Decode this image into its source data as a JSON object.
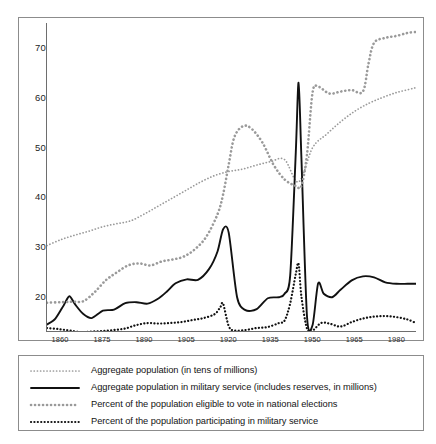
{
  "chart_data": {
    "type": "line",
    "title": "",
    "subtitle": "",
    "xlabel": "",
    "ylabel": "",
    "xlim": [
      1855,
      1987
    ],
    "ylim": [
      13,
      75
    ],
    "grid": false,
    "legend_position": "below-plot",
    "x_ticks": [
      "1860",
      "1875",
      "1890",
      "1905",
      "1920",
      "1935",
      "1950",
      "1965",
      "1980"
    ],
    "x_tick_values": [
      1860,
      1875,
      1890,
      1905,
      1920,
      1935,
      1950,
      1965,
      1980
    ],
    "y_ticks": [
      "20",
      "30",
      "40",
      "50",
      "60",
      "70"
    ],
    "y_tick_values": [
      20,
      30,
      40,
      50,
      60,
      70
    ],
    "series": [
      {
        "name": "Aggregate population (in tens of millions)",
        "style": "fine-dotted",
        "color": "#9a9a9a",
        "x": [
          1855,
          1860,
          1865,
          1870,
          1875,
          1880,
          1885,
          1890,
          1895,
          1900,
          1905,
          1910,
          1915,
          1920,
          1925,
          1930,
          1935,
          1940,
          1945,
          1950,
          1955,
          1960,
          1965,
          1970,
          1975,
          1980,
          1985,
          1987
        ],
        "values": [
          30.2,
          31.4,
          32.3,
          33.1,
          34.0,
          34.6,
          35.2,
          36.6,
          38.2,
          39.8,
          41.4,
          43.0,
          44.3,
          45.1,
          45.6,
          46.4,
          47.1,
          47.5,
          43.0,
          49.9,
          52.6,
          55.1,
          57.2,
          58.8,
          60.0,
          61.0,
          61.7,
          62.0
        ]
      },
      {
        "name": "Aggregate population in military service (includes reserves, in millions)",
        "style": "solid",
        "color": "#111111",
        "x": [
          1855,
          1858,
          1861,
          1863,
          1865,
          1868,
          1871,
          1875,
          1879,
          1883,
          1887,
          1891,
          1895,
          1898,
          1901,
          1905,
          1909,
          1913,
          1916,
          1918,
          1920,
          1923,
          1926,
          1930,
          1934,
          1938,
          1940,
          1942,
          1944,
          1945,
          1946,
          1948,
          1950,
          1952,
          1954,
          1957,
          1960,
          1964,
          1968,
          1972,
          1976,
          1980,
          1984,
          1987
        ],
        "values": [
          14.3,
          15.5,
          18.2,
          20.0,
          18.4,
          16.4,
          15.6,
          17.1,
          17.3,
          18.6,
          18.8,
          18.5,
          19.6,
          21.0,
          22.6,
          23.4,
          23.3,
          25.5,
          29.0,
          33.5,
          32.8,
          19.8,
          17.2,
          17.4,
          19.6,
          19.8,
          20.5,
          24.2,
          49.0,
          63.0,
          48.0,
          16.0,
          14.2,
          22.6,
          20.5,
          19.8,
          21.3,
          23.2,
          24.0,
          23.8,
          22.8,
          22.5,
          22.5,
          22.5
        ]
      },
      {
        "name": "Percent of the population eligible to vote in national elections",
        "style": "square-dotted",
        "color": "#9a9a9a",
        "x": [
          1855,
          1860,
          1864,
          1868,
          1872,
          1876,
          1880,
          1884,
          1888,
          1892,
          1896,
          1900,
          1904,
          1908,
          1912,
          1916,
          1918,
          1920,
          1922,
          1925,
          1928,
          1932,
          1936,
          1940,
          1944,
          1946,
          1948,
          1950,
          1952,
          1956,
          1960,
          1964,
          1968,
          1970,
          1972,
          1976,
          1980,
          1984,
          1987
        ],
        "values": [
          18.7,
          18.8,
          18.9,
          19.0,
          20.8,
          23.2,
          24.8,
          26.2,
          26.6,
          26.2,
          27.0,
          27.4,
          28.0,
          29.5,
          32.0,
          36.5,
          40.5,
          46.5,
          52.0,
          54.2,
          53.8,
          51.0,
          46.5,
          43.5,
          42.2,
          42.2,
          48.5,
          61.0,
          62.2,
          60.8,
          61.2,
          61.5,
          61.2,
          66.8,
          71.0,
          72.0,
          72.4,
          73.0,
          73.2
        ]
      },
      {
        "name": "Percent of the population participating in military service",
        "style": "bold-dotted",
        "color": "#111111",
        "x": [
          1855,
          1859,
          1863,
          1867,
          1871,
          1875,
          1879,
          1883,
          1887,
          1891,
          1895,
          1899,
          1903,
          1907,
          1911,
          1915,
          1917,
          1918,
          1920,
          1922,
          1926,
          1930,
          1934,
          1938,
          1940,
          1942,
          1944,
          1945,
          1946,
          1948,
          1950,
          1953,
          1956,
          1960,
          1964,
          1968,
          1972,
          1976,
          1980,
          1984,
          1987
        ],
        "values": [
          13.6,
          13.4,
          13.1,
          12.8,
          12.9,
          13.0,
          13.2,
          13.5,
          14.2,
          14.6,
          14.5,
          14.6,
          14.8,
          15.2,
          15.6,
          16.4,
          17.8,
          18.5,
          14.0,
          13.1,
          13.2,
          13.6,
          13.8,
          14.6,
          15.1,
          18.6,
          24.5,
          26.5,
          20.0,
          13.5,
          13.1,
          14.6,
          14.5,
          13.9,
          14.8,
          15.5,
          15.9,
          16.0,
          15.8,
          15.3,
          14.6
        ]
      }
    ]
  },
  "legend": {
    "items": [
      {
        "label": "Aggregate population (in tens of millions)",
        "style": "fine-dotted"
      },
      {
        "label": "Aggregate population in military service (includes reserves, in millions)",
        "style": "solid"
      },
      {
        "label": "Percent of the population eligible to vote in national elections",
        "style": "square-dotted"
      },
      {
        "label": "Percent of the population participating in military service",
        "style": "bold-dotted"
      }
    ]
  },
  "colors": {
    "axis": "#6e6e6e",
    "frame": "#8c8c8c",
    "solid_series": "#111111",
    "dotted_series": "#9a9a9a",
    "text": "#1a1a1a",
    "background": "#ffffff"
  }
}
